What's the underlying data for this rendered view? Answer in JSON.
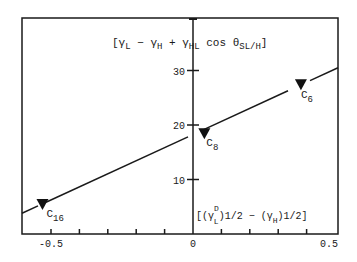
{
  "chart_data": {
    "type": "line",
    "title": "",
    "ylabel": "[γL − γH + γHL cos θSL/H]",
    "xlabel": "[(γL^D)^1/2 − (γH)^1/2]",
    "xlim": [
      -0.6,
      0.5
    ],
    "ylim": [
      0,
      33
    ],
    "x_ticks": [
      -0.5,
      0,
      0.5
    ],
    "x_tick_labels": [
      "-0.5",
      "0",
      "0.5"
    ],
    "x_minor_ticks": [
      -0.5,
      -0.4,
      -0.3,
      -0.2,
      -0.1,
      0.1,
      0.2,
      0.3,
      0.4
    ],
    "y_ticks": [
      10,
      20,
      30
    ],
    "y_tick_labels": [
      "10",
      "20",
      "30"
    ],
    "grid": false,
    "series": [
      {
        "name": "alkanes",
        "marker": "triangle-down",
        "points": [
          {
            "label": "C16",
            "x": -0.53,
            "y": 5.5
          },
          {
            "label": "C8",
            "x": 0.04,
            "y": 18.5
          },
          {
            "label": "C6",
            "x": 0.38,
            "y": 27.5
          }
        ]
      }
    ],
    "fit_line": {
      "x": [
        -0.6,
        0.5
      ],
      "y": [
        3.8,
        30.5
      ]
    },
    "point_labels": [
      {
        "base": "C",
        "sub": "16"
      },
      {
        "base": "C",
        "sub": "8"
      },
      {
        "base": "C",
        "sub": "6"
      }
    ]
  },
  "labels": {
    "y_axis": {
      "open": "[γ",
      "sub1": "L",
      "minus": " − γ",
      "sub2": "H",
      "plus": "  + γ",
      "sub3": "HL",
      "cos": " cos θ",
      "sub4": "SL/H",
      "close": "]"
    },
    "x_axis": {
      "open": "[(γ",
      "sup1": "D",
      "sub1": "L",
      "exp1": ")1/2",
      "minus": " − (γ",
      "sub2": "H",
      "exp2": ")1/2",
      "close": "]"
    }
  }
}
